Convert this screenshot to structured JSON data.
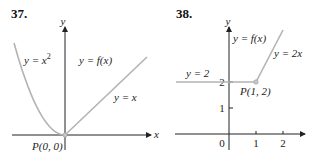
{
  "chart_data": [
    {
      "type": "line",
      "title": "37.",
      "xlabel": "x",
      "ylabel": "y",
      "series": [
        {
          "name": "y = x^2",
          "label": "y = x",
          "label_sup": "2",
          "x": [
            -1.0,
            -0.8,
            -0.6,
            -0.4,
            -0.2,
            0
          ],
          "y": [
            1.0,
            0.64,
            0.36,
            0.16,
            0.04,
            0
          ]
        },
        {
          "name": "y = x",
          "label": "y = x",
          "x": [
            0,
            1.0
          ],
          "y": [
            0,
            1.0
          ]
        }
      ],
      "function_label": "y = f(x)",
      "point": {
        "label": "P(0, 0)",
        "x": 0,
        "y": 0
      },
      "colors": {
        "curve": "#b3b3b3",
        "axis": "#222222"
      }
    },
    {
      "type": "line",
      "title": "38.",
      "xlabel": "",
      "ylabel": "y",
      "series": [
        {
          "name": "y = 2",
          "label": "y = 2",
          "x": [
            -1.0,
            1
          ],
          "y": [
            2,
            2
          ]
        },
        {
          "name": "y = 2x",
          "label": "y = 2x",
          "x": [
            1,
            2
          ],
          "y": [
            2,
            4
          ]
        }
      ],
      "function_label": "y = f(x)",
      "point": {
        "label": "P(1, 2)",
        "x": 1,
        "y": 2
      },
      "xticks": [
        "0",
        "1",
        "2"
      ],
      "yticks": [
        "1",
        "2"
      ],
      "colors": {
        "curve": "#b3b3b3",
        "axis": "#222222"
      }
    }
  ]
}
